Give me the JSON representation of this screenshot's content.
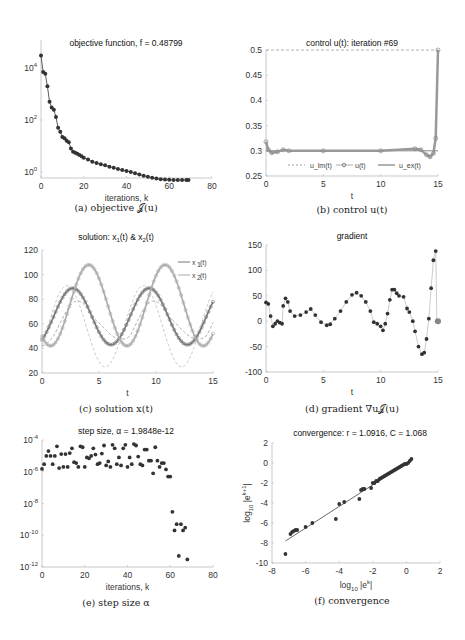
{
  "figure": {
    "panels": [
      {
        "id": "a",
        "title": "objective function, f = 0.48799",
        "xlabel": "iterations, k",
        "caption": "(a) objective 𝒥(u)"
      },
      {
        "id": "b",
        "title": "control u(t): iteration #69",
        "xlabel": "t",
        "caption": "(b) control u(t)"
      },
      {
        "id": "c",
        "title": "solution: x1(t) & x2(t)",
        "xlabel": "t",
        "caption": "(c) solution x(t)"
      },
      {
        "id": "d",
        "title": "gradient",
        "xlabel": "t",
        "caption": "(d) gradient ∇u𝒥(u)"
      },
      {
        "id": "e",
        "title": "step size, α = 1.9848e-12",
        "xlabel": "iterations, k",
        "caption": "(e) step size α"
      },
      {
        "id": "f",
        "title": "convergence: r = 1.0916, C = 1.068",
        "xlabel": "log10 |e^k|",
        "ylabel": "log10 |e^(k+1)|",
        "caption": "(f) convergence"
      }
    ]
  },
  "chart_data": [
    {
      "id": "a",
      "type": "line",
      "title": "objective function, f = 0.48799",
      "xlabel": "iterations, k",
      "ylabel": "",
      "yscale": "log",
      "xlim": [
        0,
        80
      ],
      "ylim": [
        0.5,
        40000
      ],
      "xticks": [
        0,
        20,
        40,
        60,
        80
      ],
      "yticks": [
        "10^0",
        "10^2",
        "10^4"
      ],
      "x": [
        0,
        1,
        2,
        3,
        4,
        5,
        6,
        7,
        8,
        9,
        10,
        11,
        12,
        13,
        14,
        15,
        16,
        17,
        18,
        19,
        20,
        22,
        24,
        26,
        28,
        30,
        32,
        34,
        36,
        38,
        40,
        42,
        44,
        46,
        48,
        50,
        52,
        54,
        56,
        58,
        60,
        62,
        64,
        66,
        68,
        69
      ],
      "values": [
        30000,
        7000,
        6000,
        2000,
        500,
        300,
        250,
        130,
        50,
        35,
        22,
        20,
        16,
        14,
        8,
        6,
        5.5,
        5,
        4.5,
        4,
        3.5,
        3,
        2.5,
        2.2,
        2.0,
        1.8,
        1.6,
        1.45,
        1.3,
        1.2,
        1.1,
        1.0,
        0.9,
        0.8,
        0.72,
        0.65,
        0.6,
        0.56,
        0.53,
        0.51,
        0.5,
        0.495,
        0.492,
        0.49,
        0.488,
        0.48799
      ]
    },
    {
      "id": "b",
      "type": "line",
      "title": "control u(t): iteration #69",
      "xlabel": "t",
      "xlim": [
        0,
        15
      ],
      "ylim": [
        0.25,
        0.5
      ],
      "xticks": [
        0,
        5,
        10,
        15
      ],
      "yticks": [
        0.25,
        0.3,
        0.35,
        0.4,
        0.45,
        0.5
      ],
      "legend": [
        "u_lm(t)",
        "u(t)",
        "u_ex(t)"
      ],
      "legend_position": "bottom",
      "series": [
        {
          "name": "u_lm(t)",
          "style": "dashed",
          "x": [
            0,
            15
          ],
          "values": [
            0.5,
            0.5
          ]
        },
        {
          "name": "u(t)",
          "style": "circles",
          "x": [
            0,
            0.2,
            0.5,
            1,
            1.5,
            2,
            5,
            10,
            13,
            13.5,
            14,
            14.3,
            14.6,
            14.8,
            15
          ],
          "values": [
            0.318,
            0.302,
            0.296,
            0.298,
            0.302,
            0.3,
            0.3,
            0.3,
            0.304,
            0.302,
            0.292,
            0.288,
            0.295,
            0.325,
            0.5
          ]
        },
        {
          "name": "u_ex(t)",
          "style": "solid",
          "x": [
            0,
            15
          ],
          "values": [
            0.3,
            0.3
          ]
        }
      ]
    },
    {
      "id": "c",
      "type": "line",
      "title": "solution: x1(t) & x2(t)",
      "xlabel": "t",
      "xlim": [
        0,
        15
      ],
      "ylim": [
        20,
        120
      ],
      "xticks": [
        0,
        5,
        10,
        15
      ],
      "yticks": [
        20,
        40,
        60,
        80,
        100,
        120
      ],
      "legend": [
        "x1(t)",
        "x2(t)"
      ],
      "legend_position": "upper right",
      "series": [
        {
          "name": "x1(t)",
          "peaks": [
            {
              "t": 2.7,
              "v": 90
            },
            {
              "t": 9.4,
              "v": 90
            }
          ],
          "troughs": [
            {
              "t": 1,
              "v": 43
            },
            {
              "t": 6,
              "v": 46
            },
            {
              "t": 12.8,
              "v": 46
            }
          ],
          "start": 50,
          "end": 76
        },
        {
          "name": "x2(t)",
          "peaks": [
            {
              "t": 4.1,
              "v": 108
            },
            {
              "t": 10.8,
              "v": 108
            }
          ],
          "troughs": [
            {
              "t": 0,
              "v": 50
            },
            {
              "t": 7.5,
              "v": 43
            },
            {
              "t": 14.2,
              "v": 45
            }
          ],
          "start": 50,
          "end": 46
        },
        {
          "name": "x1 reference (dashed)",
          "peaks": [
            {
              "t": 5.5,
              "v": 91
            },
            {
              "t": 13,
              "v": 91
            }
          ],
          "troughs": [
            {
              "t": 2.2,
              "v": 25
            },
            {
              "t": 9.6,
              "v": 25
            }
          ]
        },
        {
          "name": "x2 reference (dashed)",
          "peaks": [
            {
              "t": 3.8,
              "v": 105
            },
            {
              "t": 11.3,
              "v": 108
            }
          ],
          "troughs": [
            {
              "t": 0.5,
              "v": 45
            },
            {
              "t": 7,
              "v": 44
            }
          ]
        }
      ]
    },
    {
      "id": "d",
      "type": "line",
      "title": "gradient",
      "xlabel": "t",
      "xlim": [
        0,
        15
      ],
      "ylim": [
        -100,
        150
      ],
      "xticks": [
        0,
        5,
        10,
        15
      ],
      "yticks": [
        -100,
        -50,
        0,
        50,
        100,
        150
      ],
      "x": [
        0,
        0.2,
        0.4,
        0.6,
        0.8,
        1.0,
        1.2,
        1.4,
        1.5,
        1.7,
        1.9,
        2.1,
        2.5,
        3,
        3.5,
        3.9,
        4.3,
        4.8,
        5.3,
        5.6,
        6,
        6.5,
        7,
        7.5,
        7.9,
        8.3,
        8.7,
        9.1,
        9.4,
        9.7,
        10,
        10.2,
        10.4,
        10.6,
        10.8,
        11,
        11.2,
        11.4,
        11.6,
        12,
        12.3,
        12.5,
        12.8,
        13,
        13.3,
        13.6,
        13.8,
        14,
        14.2,
        14.4,
        14.6,
        14.8,
        14.9,
        15
      ],
      "values": [
        37,
        34,
        10,
        -10,
        -5,
        0,
        -3,
        -5,
        30,
        45,
        38,
        20,
        10,
        12,
        18,
        24,
        12,
        -2,
        -8,
        -6,
        5,
        20,
        38,
        52,
        56,
        50,
        38,
        20,
        -2,
        -5,
        -10,
        -18,
        -5,
        15,
        42,
        62,
        62,
        55,
        50,
        48,
        25,
        18,
        0,
        -20,
        -50,
        -65,
        -62,
        -35,
        5,
        65,
        120,
        138,
        0,
        0
      ]
    },
    {
      "id": "e",
      "type": "scatter",
      "title": "step size, α = 1.9848e-12",
      "xlabel": "iterations, k",
      "yscale": "log",
      "xlim": [
        0,
        80
      ],
      "ylim": [
        "1e-12",
        "1e-4"
      ],
      "xticks": [
        0,
        20,
        40,
        60,
        80
      ],
      "yticks": [
        "10^-12",
        "10^-10",
        "10^-8",
        "10^-6",
        "10^-4"
      ],
      "x": [
        0,
        1,
        2,
        3,
        4,
        5,
        6,
        7,
        8,
        9,
        10,
        11,
        12,
        13,
        14,
        15,
        16,
        17,
        18,
        19,
        20,
        21,
        22,
        23,
        24,
        25,
        26,
        27,
        28,
        29,
        30,
        31,
        32,
        33,
        34,
        35,
        36,
        37,
        38,
        39,
        40,
        41,
        42,
        43,
        44,
        45,
        46,
        47,
        48,
        49,
        50,
        51,
        52,
        53,
        54,
        55,
        56,
        57,
        58,
        59,
        60,
        61,
        62,
        63,
        64,
        65,
        66,
        67,
        68
      ],
      "values": [
        "1.5e-6",
        "3e-6",
        "1e-5",
        "2e-5",
        "1e-5",
        "3e-6",
        "1e-5",
        "4e-5",
        "1.7e-6",
        "1.3e-5",
        "2e-6",
        "1.3e-5",
        "2e-6",
        "1.5e-5",
        "3e-5",
        "4e-6",
        "3.5e-6",
        "2e-6",
        "4e-5",
        "3.5e-5",
        "2e-6",
        "8e-6",
        "7e-6",
        "1e-5",
        "3e-5",
        "1.2e-5",
        "3e-6",
        "3.5e-6",
        "1.4e-5",
        "4.5e-5",
        "2.5e-6",
        "4.5e-6",
        "2e-6",
        "5e-5",
        "3e-5",
        "3e-6",
        "8e-6",
        "2.5e-6",
        "3e-5",
        "5e-5",
        "2e-6",
        "8e-6",
        "3e-6",
        "5.5e-5",
        "4.5e-5",
        "9e-6",
        "3e-6",
        "2.5e-6",
        "2.5e-5",
        "2.5e-5",
        "5e-6",
        "5e-6",
        "8e-7",
        "3.5e-5",
        "5e-6",
        "2e-6",
        "3.5e-6",
        "3.5e-6",
        "1.4e-6",
        "5e-7",
        "5e-7",
        "3e-9",
        "2e-10",
        "5e-10",
        "5e-12",
        "5e-10",
        "2e-10",
        "3e-10",
        "3e-12"
      ]
    },
    {
      "id": "f",
      "type": "scatter",
      "title": "convergence: r = 1.0916, C = 1.068",
      "xlabel": "log10 |e^k|",
      "ylabel": "log10 |e^(k+1)|",
      "xlim": [
        -8,
        2
      ],
      "ylim": [
        -10,
        2
      ],
      "xticks": [
        -8,
        -6,
        -4,
        -2,
        0,
        2
      ],
      "yticks": [
        -10,
        -8,
        -6,
        -4,
        -2,
        0,
        2
      ],
      "fit_line": {
        "x": [
          -7.2,
          0.3
        ],
        "y": [
          -7.8,
          0.3
        ],
        "slope": 1.0916,
        "intercept": "log10(1.068)"
      },
      "x": [
        -7.2,
        -6.9,
        -6.8,
        -6.7,
        -6.6,
        -6.5,
        -6.0,
        -5.6,
        -4.2,
        -4.0,
        -3.7,
        -2.8,
        -2.7,
        -2.6,
        -2.5,
        -2.1,
        -2.0,
        -1.9,
        -1.8,
        -1.7,
        -1.6,
        -1.5,
        -1.4,
        -1.3,
        -1.2,
        -1.1,
        -1.0,
        -0.9,
        -0.8,
        -0.7,
        -0.6,
        -0.5,
        -0.4,
        -0.3,
        -0.2,
        -0.1,
        0.0,
        0.1,
        0.2,
        0.3
      ],
      "values": [
        -9.1,
        -7.1,
        -6.9,
        -6.8,
        -6.7,
        -6.7,
        -6.4,
        -6.0,
        -5.6,
        -4.1,
        -3.9,
        -3.6,
        -2.7,
        -2.6,
        -2.6,
        -2.5,
        -2.0,
        -2.0,
        -1.8,
        -1.8,
        -1.6,
        -1.5,
        -1.4,
        -1.3,
        -1.2,
        -1.1,
        -1.0,
        -0.9,
        -0.8,
        -0.7,
        -0.6,
        -0.5,
        -0.4,
        -0.3,
        -0.2,
        -0.1,
        -0.1,
        0.0,
        0.2,
        0.4
      ]
    }
  ]
}
